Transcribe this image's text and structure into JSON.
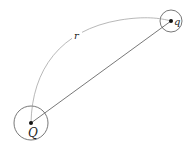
{
  "diagram": {
    "charges": [
      {
        "id": "Q",
        "label": "Q",
        "cx": 31,
        "cy": 123,
        "r": 17
      },
      {
        "id": "q",
        "label": "q",
        "cx": 171,
        "cy": 21,
        "r": 11
      }
    ],
    "distance_label": "r",
    "colors": {
      "stroke": "#555555",
      "arc": "#888888",
      "dot": "#111111"
    }
  }
}
